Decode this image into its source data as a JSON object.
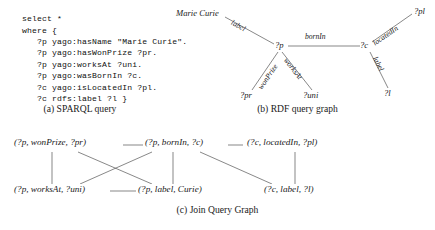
{
  "figure": {
    "panels": [
      {
        "key": "a",
        "caption": "(a) SPARQL query"
      },
      {
        "key": "b",
        "caption": "(b) RDF query graph"
      },
      {
        "key": "c",
        "caption": "(c) Join Query Graph"
      }
    ]
  },
  "sparql": {
    "code": "select *\nwhere {\n   ?p yago:hasName \"Marie Curie\".\n   ?p yago:hasWonPrize ?pr.\n   ?p yago:worksAt ?uni.\n   ?p yago:wasBornIn ?c.\n   ?c yago:isLocatedIn ?pl.\n   ?c rdfs:label ?l }",
    "lines": [
      "select *",
      "where {",
      "   ?p yago:hasName \"Marie Curie\".",
      "   ?p yago:hasWonPrize ?pr.",
      "   ?p yago:worksAt ?uni.",
      "   ?p yago:wasBornIn ?c.",
      "   ?c yago:isLocatedIn ?pl.",
      "   ?c rdfs:label ?l }"
    ]
  },
  "rdf_graph": {
    "nodes": [
      {
        "id": "marie_curie",
        "label": "Marie Curie"
      },
      {
        "id": "p",
        "label": "?p"
      },
      {
        "id": "c",
        "label": "?c"
      },
      {
        "id": "pr",
        "label": "?pr"
      },
      {
        "id": "uni",
        "label": "?uni"
      },
      {
        "id": "pl",
        "label": "?pl"
      },
      {
        "id": "l",
        "label": "?l"
      }
    ],
    "edges": [
      {
        "from": "marie_curie",
        "to": "p",
        "label": "label"
      },
      {
        "from": "p",
        "to": "c",
        "label": "bornIn"
      },
      {
        "from": "p",
        "to": "pr",
        "label": "wonPrize"
      },
      {
        "from": "p",
        "to": "uni",
        "label": "worksAt"
      },
      {
        "from": "c",
        "to": "pl",
        "label": "locatedIn"
      },
      {
        "from": "c",
        "to": "l",
        "label": "label"
      }
    ]
  },
  "join_graph": {
    "nodes": [
      {
        "id": "n1",
        "label": "(?p, wonPrize, ?pr)"
      },
      {
        "id": "n2",
        "label": "(?p, bornIn, ?c)"
      },
      {
        "id": "n3",
        "label": "(?c, locatedIn, ?pl)"
      },
      {
        "id": "n4",
        "label": "(?p, worksAt, ?uni)"
      },
      {
        "id": "n5",
        "label": "(?p, label, Curie)"
      },
      {
        "id": "n6",
        "label": "(?c, label, ?l)"
      }
    ],
    "edges": [
      {
        "from": "n1",
        "to": "n2"
      },
      {
        "from": "n2",
        "to": "n3"
      },
      {
        "from": "n1",
        "to": "n4"
      },
      {
        "from": "n1",
        "to": "n5"
      },
      {
        "from": "n2",
        "to": "n4"
      },
      {
        "from": "n2",
        "to": "n5"
      },
      {
        "from": "n4",
        "to": "n5"
      },
      {
        "from": "n3",
        "to": "n6"
      }
    ]
  },
  "colors": {
    "ink": "#1a1a1a",
    "line": "#555555",
    "background": "#ffffff"
  }
}
